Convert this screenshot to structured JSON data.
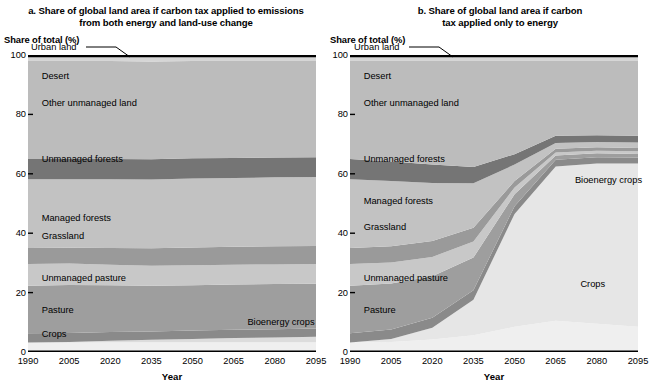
{
  "figure": {
    "y_axis_title": "Share of total (%)",
    "x_axis_title": "Year"
  },
  "panels": [
    {
      "id": "a",
      "title": "a. Share of global land area if carbon tax applied to emissions from both energy and land-use change",
      "title_line1": "a. Share of global land area if carbon tax applied to emissions",
      "title_line2": "from both energy and land-use change"
    },
    {
      "id": "b",
      "title": "b. Share of global land area if carbon tax applied only to energy",
      "title_line1": "b. Share of global land area if carbon",
      "title_line2": "tax applied only to energy"
    }
  ],
  "chart_data": [
    {
      "type": "area",
      "panel": "a",
      "title": "a. Share of global land area if carbon tax applied to emissions from both energy and land-use change",
      "xlabel": "Year",
      "ylabel": "Share of total (%)",
      "x": [
        1990,
        2005,
        2020,
        2035,
        2050,
        2065,
        2080,
        2095
      ],
      "xlim": [
        1990,
        2095
      ],
      "ylim": [
        0,
        100
      ],
      "yticks": [
        0,
        20,
        40,
        60,
        80,
        100
      ],
      "xticks": [
        1990,
        2005,
        2020,
        2035,
        2050,
        2065,
        2080,
        2095
      ],
      "grid": false,
      "legend": "inline-labels",
      "stack_order_bottom_to_top": [
        "Crops",
        "Bioenergy crops",
        "Pasture",
        "Unmanaged pasture",
        "Grassland",
        "Managed forests",
        "Unmanaged forests",
        "Other unmanaged land",
        "Desert",
        "Urban land"
      ],
      "series": [
        {
          "name": "Crops",
          "color": "#efefef",
          "values": [
            3.2,
            3.2,
            3.3,
            3.3,
            3.3,
            3.3,
            3.3,
            3.3
          ]
        },
        {
          "name": "Bioenergy crops",
          "color": "#dcdcdc",
          "values": [
            0.0,
            0.2,
            0.5,
            0.8,
            1.1,
            1.4,
            1.6,
            1.8
          ]
        },
        {
          "name": "Pasture",
          "color": "#8a8a8a",
          "values": [
            3.1,
            3.0,
            2.9,
            2.8,
            2.8,
            2.8,
            2.8,
            2.8
          ]
        },
        {
          "name": "Unmanaged pasture",
          "color": "#9e9e9e",
          "values": [
            16.0,
            16.2,
            15.8,
            15.4,
            15.3,
            15.2,
            15.2,
            15.1
          ]
        },
        {
          "name": "Grassland",
          "color": "#c8c8c8",
          "values": [
            7.3,
            7.2,
            6.9,
            6.7,
            6.7,
            6.7,
            6.6,
            6.6
          ]
        },
        {
          "name": "Managed forests",
          "color": "#9a9a9a",
          "values": [
            5.4,
            5.3,
            5.6,
            5.9,
            6.0,
            6.0,
            6.1,
            6.1
          ]
        },
        {
          "name": "Unmanaged forests",
          "color": "#c2c2c2",
          "values": [
            23.2,
            23.1,
            23.2,
            23.2,
            23.2,
            23.2,
            23.2,
            23.2
          ]
        },
        {
          "name": "Other unmanaged land",
          "color": "#757575",
          "values": [
            6.8,
            6.8,
            6.8,
            6.8,
            6.8,
            6.7,
            6.7,
            6.7
          ]
        },
        {
          "name": "Desert",
          "color": "#bcbcbc",
          "values": [
            33.0,
            33.0,
            33.0,
            32.9,
            32.8,
            32.7,
            32.5,
            32.4
          ]
        },
        {
          "name": "Urban land",
          "color": "#d6d6d6",
          "values": [
            2.0,
            2.0,
            2.0,
            2.2,
            2.0,
            2.0,
            2.0,
            2.0
          ]
        }
      ],
      "annotations": [
        {
          "text": "Urban land",
          "x": 1990,
          "y": 102,
          "leader": true
        },
        {
          "text": "Desert",
          "x": 1995,
          "y": 93
        },
        {
          "text": "Other unmanaged land",
          "x": 1995,
          "y": 84
        },
        {
          "text": "Unmanaged forests",
          "x": 1995,
          "y": 65
        },
        {
          "text": "Managed forests",
          "x": 1995,
          "y": 45
        },
        {
          "text": "Grassland",
          "x": 1995,
          "y": 39
        },
        {
          "text": "Unmanaged pasture",
          "x": 1995,
          "y": 25
        },
        {
          "text": "Pasture",
          "x": 1995,
          "y": 14
        },
        {
          "text": "Crops",
          "x": 1995,
          "y": 6
        },
        {
          "text": "Bioenergy crops",
          "x": 2070,
          "y": 10
        }
      ]
    },
    {
      "type": "area",
      "panel": "b",
      "title": "b. Share of global land area if carbon tax applied only to energy",
      "xlabel": "Year",
      "ylabel": "Share of total (%)",
      "x": [
        1990,
        2005,
        2020,
        2035,
        2050,
        2065,
        2080,
        2095
      ],
      "xlim": [
        1990,
        2095
      ],
      "ylim": [
        0,
        100
      ],
      "yticks": [
        0,
        20,
        40,
        60,
        80,
        100
      ],
      "xticks": [
        1990,
        2005,
        2020,
        2035,
        2050,
        2065,
        2080,
        2095
      ],
      "grid": false,
      "legend": "inline-labels",
      "stack_order_bottom_to_top": [
        "Crops",
        "Bioenergy crops",
        "Pasture",
        "Unmanaged pasture",
        "Grassland",
        "Managed forests",
        "Unmanaged forests",
        "Other unmanaged land",
        "Desert",
        "Urban land"
      ],
      "series": [
        {
          "name": "Crops",
          "color": "#efefef",
          "values": [
            3.2,
            3.4,
            4.2,
            5.6,
            8.5,
            10.5,
            9.5,
            8.5
          ]
        },
        {
          "name": "Bioenergy crops",
          "color": "#e6e6e6",
          "values": [
            0.0,
            1.0,
            4.0,
            12.0,
            38.0,
            52.0,
            54.0,
            55.0
          ]
        },
        {
          "name": "Pasture",
          "color": "#8a8a8a",
          "values": [
            3.1,
            3.2,
            3.3,
            3.2,
            2.6,
            2.2,
            2.1,
            2.0
          ]
        },
        {
          "name": "Unmanaged pasture",
          "color": "#9e9e9e",
          "values": [
            16.0,
            15.5,
            14.0,
            11.0,
            4.0,
            1.5,
            1.3,
            1.2
          ]
        },
        {
          "name": "Grassland",
          "color": "#c8c8c8",
          "values": [
            7.3,
            7.0,
            6.5,
            5.4,
            2.3,
            1.0,
            0.9,
            0.9
          ]
        },
        {
          "name": "Managed forests",
          "color": "#9a9a9a",
          "values": [
            5.4,
            5.5,
            5.4,
            4.6,
            2.2,
            1.2,
            1.1,
            1.1
          ]
        },
        {
          "name": "Unmanaged forests",
          "color": "#c2c2c2",
          "values": [
            23.2,
            22.0,
            19.5,
            15.0,
            5.5,
            2.0,
            1.8,
            1.8
          ]
        },
        {
          "name": "Other unmanaged land",
          "color": "#757575",
          "values": [
            6.8,
            6.5,
            6.2,
            5.5,
            3.5,
            2.4,
            2.3,
            2.3
          ]
        },
        {
          "name": "Desert",
          "color": "#bcbcbc",
          "values": [
            33.0,
            33.9,
            34.9,
            35.7,
            31.4,
            25.2,
            25.0,
            25.2
          ]
        },
        {
          "name": "Urban land",
          "color": "#d6d6d6",
          "values": [
            2.0,
            2.0,
            2.0,
            2.0,
            2.0,
            2.0,
            2.0,
            2.0
          ]
        }
      ],
      "annotations": [
        {
          "text": "Urban land",
          "x": 1990,
          "y": 102,
          "leader": true
        },
        {
          "text": "Desert",
          "x": 1995,
          "y": 93
        },
        {
          "text": "Other unmanaged land",
          "x": 1995,
          "y": 84
        },
        {
          "text": "Unmanaged forests",
          "x": 1995,
          "y": 65
        },
        {
          "text": "Managed forests",
          "x": 1995,
          "y": 51
        },
        {
          "text": "Grassland",
          "x": 1995,
          "y": 42
        },
        {
          "text": "Unmanaged pasture",
          "x": 1995,
          "y": 25
        },
        {
          "text": "Pasture",
          "x": 1995,
          "y": 14
        },
        {
          "text": "Bioenergy crops",
          "x": 2072,
          "y": 58
        },
        {
          "text": "Crops",
          "x": 2074,
          "y": 23
        }
      ]
    }
  ]
}
